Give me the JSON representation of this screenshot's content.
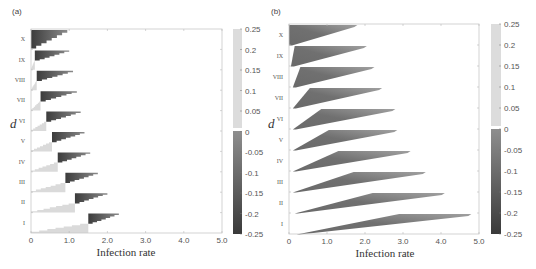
{
  "figure": {
    "panels": [
      {
        "id": "a",
        "label": "(a)",
        "xlabel": "Infection rate",
        "ylabel": "d",
        "xticks": [
          "0",
          "1.0",
          "2.0",
          "3.0",
          "4.0",
          "5.0"
        ],
        "row_labels": [
          "X",
          "IX",
          "VIII",
          "VII",
          "VI",
          "V",
          "IV",
          "III",
          "II",
          "I"
        ],
        "colorbar": {
          "ticks": [
            "0.25",
            "0.2",
            "0.15",
            "0.1",
            "0.05",
            "0",
            "-0.05",
            "-0.1",
            "-0.15",
            "-0.2",
            "-0.25"
          ]
        }
      },
      {
        "id": "b",
        "label": "(b)",
        "xlabel": "Infection rate",
        "ylabel": "d",
        "xticks": [
          "0",
          "1.0",
          "2.0",
          "3.0",
          "4.0",
          "5.0"
        ],
        "row_labels": [
          "X",
          "IX",
          "VIII",
          "VII",
          "VI",
          "V",
          "IV",
          "III",
          "II",
          "I"
        ],
        "colorbar": {
          "ticks": [
            "0.25",
            "0.2",
            "0.15",
            "0.1",
            "0.05",
            "0",
            "-0.05",
            "-0.1",
            "-0.15",
            "-0.2",
            "-0.25"
          ]
        }
      }
    ]
  },
  "chart_data": [
    {
      "type": "heatmap",
      "panel": "(a)",
      "title": "",
      "xlabel": "Infection rate",
      "ylabel": "d",
      "xlim": [
        0,
        5.0
      ],
      "xticks": [
        0,
        1.0,
        2.0,
        3.0,
        4.0,
        5.0
      ],
      "categories": [
        "X",
        "IX",
        "VIII",
        "VII",
        "VI",
        "V",
        "IV",
        "III",
        "II",
        "I"
      ],
      "colorbar": {
        "range": [
          -0.25,
          0.25
        ],
        "ticks": [
          0.25,
          0.2,
          0.15,
          0.1,
          0.05,
          0,
          -0.05,
          -0.1,
          -0.15,
          -0.2,
          -0.25
        ]
      },
      "rows": [
        {
          "d": "X",
          "positive_region": [
            0.0,
            0.0
          ],
          "negative_region": [
            0.0,
            0.95
          ]
        },
        {
          "d": "IX",
          "positive_region": [
            0.0,
            0.1
          ],
          "negative_region": [
            0.1,
            1.0
          ]
        },
        {
          "d": "VIII",
          "positive_region": [
            0.0,
            0.15
          ],
          "negative_region": [
            0.15,
            1.1
          ]
        },
        {
          "d": "VII",
          "positive_region": [
            0.0,
            0.25
          ],
          "negative_region": [
            0.25,
            1.2
          ]
        },
        {
          "d": "VI",
          "positive_region": [
            0.0,
            0.4
          ],
          "negative_region": [
            0.4,
            1.3
          ]
        },
        {
          "d": "V",
          "positive_region": [
            0.0,
            0.55
          ],
          "negative_region": [
            0.55,
            1.4
          ]
        },
        {
          "d": "IV",
          "positive_region": [
            0.0,
            0.7
          ],
          "negative_region": [
            0.7,
            1.55
          ]
        },
        {
          "d": "III",
          "positive_region": [
            0.0,
            0.9
          ],
          "negative_region": [
            0.9,
            1.75
          ]
        },
        {
          "d": "II",
          "positive_region": [
            0.0,
            1.15
          ],
          "negative_region": [
            1.15,
            2.0
          ]
        },
        {
          "d": "I",
          "positive_region": [
            0.0,
            1.5
          ],
          "negative_region": [
            1.5,
            2.3
          ]
        }
      ]
    },
    {
      "type": "heatmap",
      "panel": "(b)",
      "title": "",
      "xlabel": "Infection rate",
      "ylabel": "d",
      "xlim": [
        0,
        5.0
      ],
      "xticks": [
        0,
        1.0,
        2.0,
        3.0,
        4.0,
        5.0
      ],
      "categories": [
        "X",
        "IX",
        "VIII",
        "VII",
        "VI",
        "V",
        "IV",
        "III",
        "II",
        "I"
      ],
      "colorbar": {
        "range": [
          -0.25,
          0.25
        ],
        "ticks": [
          0.25,
          0.2,
          0.15,
          0.1,
          0.05,
          0,
          -0.05,
          -0.1,
          -0.15,
          -0.2,
          -0.25
        ]
      },
      "rows": [
        {
          "d": "X",
          "negative_region": [
            0.0,
            1.8
          ],
          "top_start": 0.0
        },
        {
          "d": "IX",
          "negative_region": [
            0.05,
            2.05
          ],
          "top_start": 0.15
        },
        {
          "d": "VIII",
          "negative_region": [
            0.1,
            2.25
          ],
          "top_start": 0.3
        },
        {
          "d": "VII",
          "negative_region": [
            0.1,
            2.45
          ],
          "top_start": 0.55
        },
        {
          "d": "VI",
          "negative_region": [
            0.1,
            2.8
          ],
          "top_start": 0.85
        },
        {
          "d": "V",
          "negative_region": [
            0.1,
            2.85
          ],
          "top_start": 1.05
        },
        {
          "d": "IV",
          "negative_region": [
            0.1,
            3.2
          ],
          "top_start": 1.3
        },
        {
          "d": "III",
          "negative_region": [
            0.1,
            3.6
          ],
          "top_start": 1.7
        },
        {
          "d": "II",
          "negative_region": [
            0.15,
            4.1
          ],
          "top_start": 2.2
        },
        {
          "d": "I",
          "negative_region": [
            0.2,
            4.8
          ],
          "top_start": 2.9
        }
      ]
    }
  ]
}
